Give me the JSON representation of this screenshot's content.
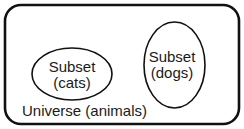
{
  "diagram": {
    "type": "venn",
    "universe": {
      "label": "Universe (animals)"
    },
    "subsets": [
      {
        "line1": "Subset",
        "line2": "(cats)"
      },
      {
        "line1": "Subset",
        "line2": "(dogs)"
      }
    ],
    "colors": {
      "stroke": "#111111",
      "text": "#1a1a1a",
      "background": "#ffffff"
    }
  }
}
